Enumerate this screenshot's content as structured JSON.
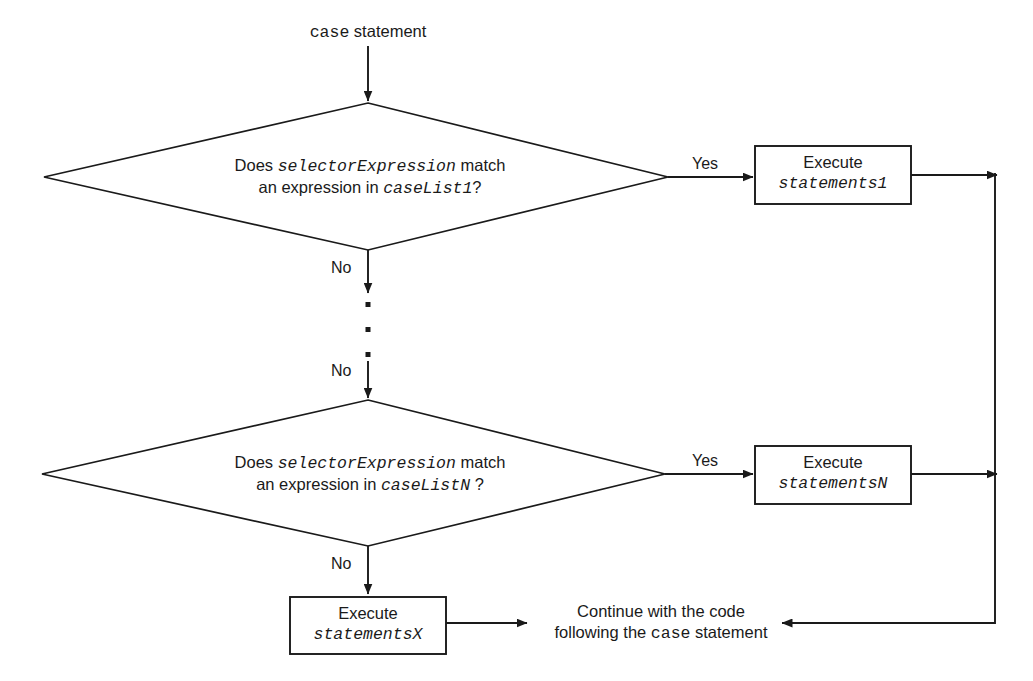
{
  "diagram": {
    "type": "flowchart",
    "title_label": {
      "code_part": "case",
      "text_part": " statement",
      "x": 368,
      "y": 30
    },
    "decisions": [
      {
        "id": "decision-1",
        "line1_pre": "Does ",
        "line1_code": "selectorExpression",
        "line1_post": " match",
        "line2_pre": "an expression in ",
        "line2_code": "caseList1",
        "line2_post": "?",
        "yes_label": "Yes",
        "no_label": "No"
      },
      {
        "id": "decision-2",
        "line1_pre": "Does ",
        "line1_code": "selectorExpression",
        "line1_post": " match",
        "line2_pre": "an expression in ",
        "line2_code": "caseListN",
        "line2_post": " ?",
        "yes_label": "Yes",
        "no_label": "No"
      }
    ],
    "process_boxes": [
      {
        "id": "execute-statements-1",
        "line1": "Execute",
        "line2_code": "statements1"
      },
      {
        "id": "execute-statements-n",
        "line1": "Execute",
        "line2_code": "statementsN"
      },
      {
        "id": "execute-statements-x",
        "line1": "Execute",
        "line2_code": "statementsX"
      }
    ],
    "terminal_text": {
      "line1": "Continue with the code",
      "line2_pre": "following the ",
      "line2_code": "case",
      "line2_post": " statement"
    },
    "ellipsis": {
      "dot_count": 3,
      "label": "vertical-ellipsis"
    },
    "colors": {
      "stroke": "#1a1a1a",
      "background": "#ffffff",
      "text": "#1a1a1a"
    }
  }
}
